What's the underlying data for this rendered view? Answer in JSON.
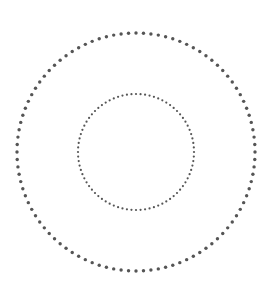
{
  "diagram": {
    "type": "concentric-dotted-circles",
    "center": {
      "x": 136,
      "y": 152
    },
    "dot_color": "#555555",
    "background": "#ffffff",
    "circles": [
      {
        "name": "outer",
        "radius": 119,
        "dot_count": 100,
        "dot_radius": 1.7
      },
      {
        "name": "inner",
        "radius": 58,
        "dot_count": 80,
        "dot_radius": 1.1
      }
    ]
  }
}
